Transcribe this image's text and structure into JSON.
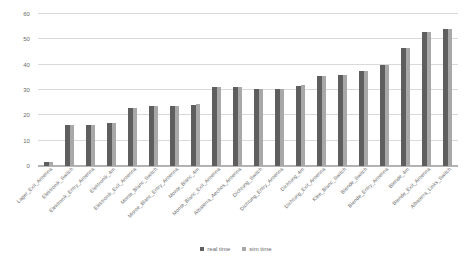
{
  "chart_data": {
    "type": "bar",
    "title": "",
    "xlabel": "",
    "ylabel": "",
    "ylim": [
      0,
      60
    ],
    "yticks": [
      0,
      10,
      20,
      30,
      40,
      50,
      60
    ],
    "grid": true,
    "legend_position": "bottom",
    "categories": [
      "Lager_Exit_Antenna",
      "Elektronik_Switch",
      "Elektronik_Entry_Antenna",
      "Elektronik_4m",
      "Elektronik_Exit_Antenna",
      "Monte_Blanc_Switch",
      "Monte_Blanc_Entry_Antenna",
      "Monte_Blanc_4m",
      "Monte_Blanc_Exit_Antenna",
      "Albaterra_Aechos_Antenna",
      "Dichtung_Switch",
      "Dichtung_Entry_Antenna",
      "Dichtung_4m",
      "Dichtung_Exit_Antenna",
      "Klee_Blanc_Switch",
      "Blende_Switch",
      "Blende_Entry_Antenna",
      "Blende_4m",
      "Blende_Exit_Antenna",
      "Albaterra_Links_Switch"
    ],
    "series": [
      {
        "name": "real time",
        "color": "#5e5e5e",
        "values": [
          1.5,
          16,
          16,
          17,
          23,
          23.5,
          23.5,
          24,
          31,
          31,
          30.5,
          30.5,
          31.5,
          35.5,
          36,
          37.5,
          40,
          46.5,
          53,
          54
        ]
      },
      {
        "name": "sim time",
        "color": "#a8a8a8",
        "values": [
          1.5,
          16,
          16,
          17,
          23,
          23.5,
          23.5,
          24.5,
          31,
          31,
          30.5,
          30.5,
          32,
          35.5,
          36,
          37.5,
          40,
          46.5,
          53,
          54
        ]
      }
    ]
  },
  "legend": {
    "items": [
      {
        "label": "real time"
      },
      {
        "label": "sim time"
      }
    ]
  }
}
